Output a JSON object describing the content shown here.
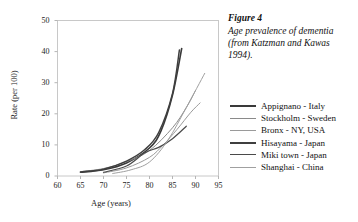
{
  "caption": {
    "title": "Figure 4",
    "body": "Age prevalence of dementia (from Katzman and Kawas 1994)."
  },
  "chart_data": {
    "type": "line",
    "title": "",
    "xlabel": "Age (years)",
    "ylabel": "Rate (per 100)",
    "xlim": [
      60,
      95
    ],
    "ylim": [
      0,
      50
    ],
    "xticks": [
      60,
      65,
      70,
      75,
      80,
      85,
      90,
      95
    ],
    "yticks": [
      0,
      10,
      20,
      30,
      40,
      50
    ],
    "grid": false,
    "legend_position": "right",
    "series": [
      {
        "name": "Appignano - Italy",
        "color": "#3a3a3a",
        "width": 1.6,
        "x": [
          65,
          70,
          75,
          80,
          82.5,
          85,
          87
        ],
        "y": [
          1.2,
          2.0,
          4.2,
          9.0,
          14.5,
          26.0,
          41.0
        ]
      },
      {
        "name": "Stockholm - Sweden",
        "color": "#8a8a8a",
        "width": 1.0,
        "x": [
          65,
          70,
          75,
          80,
          85,
          88,
          90
        ],
        "y": [
          1.4,
          2.4,
          4.6,
          8.2,
          15.5,
          22.0,
          27.5
        ]
      },
      {
        "name": "Bronx - NY, USA",
        "color": "#9a9a9a",
        "width": 1.0,
        "x": [
          70,
          75,
          80,
          83,
          86,
          89,
          91
        ],
        "y": [
          1.0,
          2.6,
          6.0,
          10.0,
          15.0,
          20.5,
          23.5
        ]
      },
      {
        "name": "Hisayama - Japan",
        "color": "#3f3f3f",
        "width": 1.5,
        "x": [
          65,
          70,
          75,
          79,
          82,
          85,
          86.5
        ],
        "y": [
          1.3,
          2.2,
          4.8,
          8.5,
          14.0,
          26.5,
          40.5
        ]
      },
      {
        "name": "Miki town - Japan",
        "color": "#4a4a4a",
        "width": 1.2,
        "x": [
          70,
          75,
          79,
          82,
          85,
          88
        ],
        "y": [
          1.2,
          3.2,
          7.5,
          9.2,
          12.0,
          16.0
        ]
      },
      {
        "name": "Shanghai - China",
        "color": "#a0a0a0",
        "width": 1.0,
        "x": [
          72,
          76,
          80,
          84,
          88,
          92
        ],
        "y": [
          0.8,
          2.0,
          4.5,
          11.5,
          22.0,
          33.0
        ]
      }
    ]
  }
}
